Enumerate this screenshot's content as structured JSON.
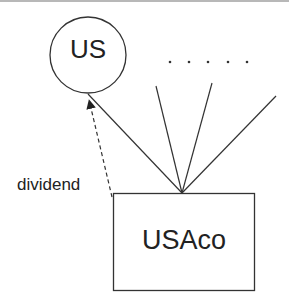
{
  "diagram": {
    "nodes": [
      {
        "id": "us",
        "label": "US",
        "shape": "circle"
      },
      {
        "id": "usaco",
        "label": "USAco",
        "shape": "rectangle"
      }
    ],
    "edges": [
      {
        "from": "usaco",
        "to": "us",
        "label": "dividend",
        "style": "dashed",
        "arrow": true
      },
      {
        "from": "usaco",
        "to": "us",
        "style": "solid"
      },
      {
        "from": "usaco",
        "to": "other-1",
        "style": "solid"
      },
      {
        "from": "usaco",
        "to": "other-2",
        "style": "solid"
      },
      {
        "from": "usaco",
        "to": "other-3",
        "style": "solid"
      }
    ],
    "ellipsis": ". . . . .",
    "colors": {
      "stroke": "#333333",
      "border_top": "#b8b8b8"
    }
  }
}
